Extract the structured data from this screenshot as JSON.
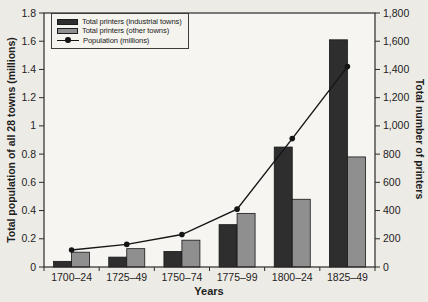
{
  "chart_data": {
    "type": "bar",
    "subtype": "grouped-bars-with-line-overlay",
    "categories": [
      "1700–24",
      "1725–49",
      "1750–74",
      "1775–99",
      "1800–24",
      "1825–49"
    ],
    "series": [
      {
        "name": "Total printers (industrial towns)",
        "render": "bar",
        "axis": "right",
        "values": [
          40,
          70,
          110,
          300,
          850,
          1610
        ],
        "color": "#2e2e2e"
      },
      {
        "name": "Total printers (other towns)",
        "render": "bar",
        "axis": "right",
        "values": [
          105,
          130,
          190,
          380,
          480,
          780
        ],
        "color": "#8f8f8f"
      },
      {
        "name": "Population (millions)",
        "render": "line",
        "axis": "left",
        "values": [
          0.12,
          0.16,
          0.23,
          0.41,
          0.91,
          1.42
        ],
        "color": "#151515"
      }
    ],
    "xlabel": "Years",
    "ylabel_left": "Total population of all 28 towns (millions)",
    "ylabel_right": "Total number of printers",
    "ylim_left": [
      0,
      1.8
    ],
    "ylim_right": [
      0,
      1800
    ],
    "yticks_left": [
      "0",
      "0.2",
      "0.4",
      "0.6",
      "0.8",
      "1",
      "1.2",
      "1.4",
      "1.6",
      "1.8"
    ],
    "yticks_right": [
      "0",
      "200",
      "400",
      "600",
      "800",
      "1,000",
      "1,200",
      "1,400",
      "1,600",
      "1,800"
    ],
    "grid": false,
    "legend": {
      "position": "top-left-inside",
      "entries": [
        "Total printers (industrial towns)",
        "Total printers (other towns)",
        "Population (millions)"
      ]
    },
    "colors": {
      "paper": "#edebe5",
      "plot_background": "#f6f5f1",
      "frame": "#2b2b2b",
      "bar_industrial": "#2e2e2e",
      "bar_other": "#8f8f8f",
      "line": "#151515",
      "text": "#1d1d1d"
    }
  }
}
